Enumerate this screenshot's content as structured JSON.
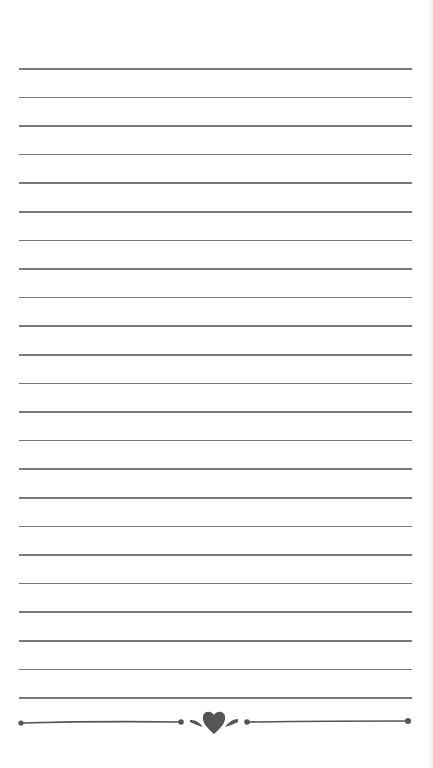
{
  "paper": {
    "type": "lined-note-paper",
    "background_color": "#ffffff",
    "line_color": "#7a7a7a",
    "line_count": 23,
    "first_line_y": 68,
    "line_spacing": 28.6,
    "line_left": 19,
    "line_right": 412
  },
  "footer_ornament": {
    "icon": "heart-divider-icon",
    "color": "#555555"
  }
}
